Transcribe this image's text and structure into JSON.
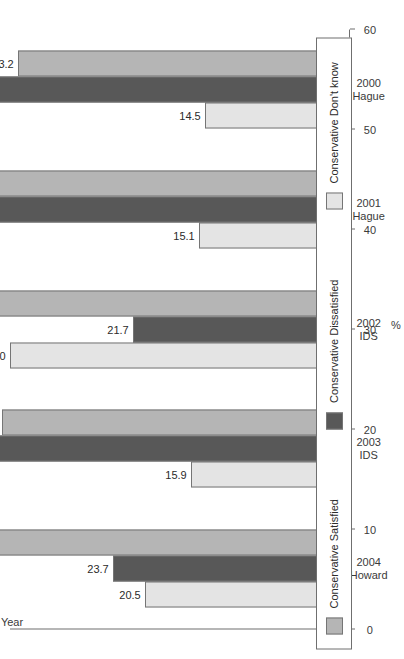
{
  "chart_data": {
    "type": "bar",
    "orientation": "horizontal",
    "title": "",
    "xlabel": "%",
    "ylabel": "Year",
    "xlim": [
      0,
      60
    ],
    "xticks": [
      "0",
      "10",
      "20",
      "30",
      "40",
      "50",
      "60"
    ],
    "grid": false,
    "legend_position": "bottom",
    "categories": [
      "2000 Hague",
      "2001 Hague",
      "2002 IDS",
      "2003 IDS",
      "2004 Howard"
    ],
    "category_lines": [
      {
        "year": "2000",
        "leader": "Hague"
      },
      {
        "year": "2001",
        "leader": "Hague"
      },
      {
        "year": "2002",
        "leader": "IDS"
      },
      {
        "year": "2003",
        "leader": "IDS"
      },
      {
        "year": "2004",
        "leader": "Howard"
      }
    ],
    "series": [
      {
        "name": "Conservative Satisfied",
        "color": "#b5b5b5",
        "values": [
          33.2,
          40.6,
          44.3,
          34.8,
          55.8
        ],
        "labels": [
          "33.2",
          "40.6",
          "44.3",
          "34.8",
          "55.8"
        ]
      },
      {
        "name": "Conservative Dissatisfied",
        "color": "#585858",
        "values": [
          52.3,
          44.3,
          21.7,
          49.3,
          23.7
        ],
        "labels": [
          "52.3",
          "44.3",
          "21.7",
          "49.3",
          "23.7"
        ]
      },
      {
        "name": "Conservative Don't know",
        "color": "#e4e4e4",
        "values": [
          14.5,
          15.1,
          34.0,
          15.9,
          20.5
        ],
        "labels": [
          "14.5",
          "15.1",
          "34.0",
          "15.9",
          "20.5"
        ]
      }
    ]
  },
  "axes": {
    "value_axis_title": "%",
    "category_axis_title": "Year"
  },
  "legend": {
    "items": [
      {
        "label": "Conservative Satisfied",
        "color": "#b5b5b5"
      },
      {
        "label": "Conservative Dissatisfied",
        "color": "#585858"
      },
      {
        "label": "Conservative Don't know",
        "color": "#e4e4e4"
      }
    ]
  }
}
